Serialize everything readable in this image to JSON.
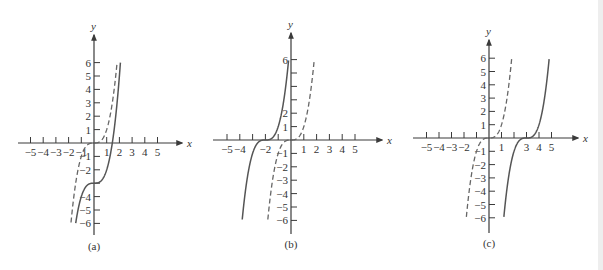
{
  "chart_data": [
    {
      "type": "line",
      "panel": "(a)",
      "title": "",
      "xlabel": "x",
      "ylabel": "y",
      "xlim": [
        -6,
        6
      ],
      "ylim": [
        -6,
        6
      ],
      "grid": false,
      "x_tick_labels": [
        "-5",
        "-4",
        "-3",
        "-2",
        "-1",
        "1",
        "2",
        "3",
        "4",
        "5"
      ],
      "y_tick_labels": [
        "6",
        "5",
        "4",
        "3",
        "2",
        "1",
        "-1",
        "-2",
        "-4",
        "-5",
        "-6"
      ],
      "series": [
        {
          "name": "y = x^3",
          "style": "dashed",
          "shift_x": 0,
          "shift_y": 0
        },
        {
          "name": "y = x^3 - 3",
          "style": "solid",
          "shift_x": 0,
          "shift_y": -3
        }
      ],
      "caption": "(a)"
    },
    {
      "type": "line",
      "panel": "(b)",
      "title": "",
      "xlabel": "x",
      "ylabel": "y",
      "xlim": [
        -6,
        6
      ],
      "ylim": [
        -6,
        6
      ],
      "grid": false,
      "x_tick_labels": [
        "-5",
        "-4",
        "-2",
        "1",
        "2",
        "3",
        "4",
        "5"
      ],
      "y_tick_labels": [
        "6",
        "2",
        "1",
        "-1",
        "-2",
        "-3",
        "-4",
        "-5",
        "-6"
      ],
      "series": [
        {
          "name": "y = x^3",
          "style": "dashed",
          "shift_x": 0,
          "shift_y": 0
        },
        {
          "name": "y = (x + 2)^3",
          "style": "solid",
          "shift_x": -2,
          "shift_y": 0
        }
      ],
      "caption": "(b)"
    },
    {
      "type": "line",
      "panel": "(c)",
      "title": "",
      "xlabel": "x",
      "ylabel": "y",
      "xlim": [
        -6,
        6
      ],
      "ylim": [
        -6,
        6
      ],
      "grid": false,
      "x_tick_labels": [
        "-5",
        "-4",
        "-3",
        "-2",
        "1",
        "3",
        "4",
        "5"
      ],
      "y_tick_labels": [
        "6",
        "5",
        "4",
        "3",
        "2",
        "1",
        "-1",
        "-2",
        "-3",
        "-4",
        "-5",
        "-6"
      ],
      "series": [
        {
          "name": "y = x^3",
          "style": "dashed",
          "shift_x": 0,
          "shift_y": 0
        },
        {
          "name": "y = (x - 3)^3",
          "style": "solid",
          "shift_x": 3,
          "shift_y": 0
        }
      ],
      "caption": "(c)"
    }
  ],
  "panels": [
    {
      "caption": "(a)",
      "x_axis_label": "x",
      "y_axis_label": "y"
    },
    {
      "caption": "(b)",
      "x_axis_label": "x",
      "y_axis_label": "y"
    },
    {
      "caption": "(c)",
      "x_axis_label": "x",
      "y_axis_label": "y"
    }
  ],
  "colors": {
    "axis": "#3a3a3a",
    "curve_solid": "#555555",
    "curve_dashed": "#666666",
    "background": "#ffffff"
  }
}
